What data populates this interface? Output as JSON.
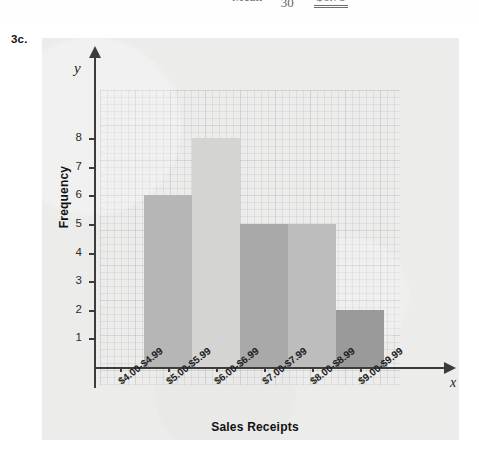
{
  "equation_strip": {
    "label": "Mean =",
    "numerator": "",
    "denominator": "30",
    "equals": "=",
    "result": "$6.75"
  },
  "problem": {
    "number": "3c."
  },
  "chart_data": {
    "type": "bar",
    "title": "",
    "xlabel": "Sales Receipts",
    "ylabel": "Frequency",
    "x_axis_variable": "x",
    "y_axis_variable": "y",
    "categories": [
      "$4.00-$4.99",
      "$5.00-$5.99",
      "$6.00-$6.99",
      "$7.00-$7.99",
      "$8.00-$8.99",
      "$9.00-$9.99"
    ],
    "values": [
      0,
      6,
      8,
      5,
      5,
      2
    ],
    "bar_colors": [
      "#ececeb",
      "#b6b6b6",
      "#d4d4d3",
      "#a9a9a9",
      "#bdbdbd",
      "#9a9a9a"
    ],
    "ytick_labels": [
      "1",
      "2",
      "3",
      "4",
      "5",
      "6",
      "7",
      "8"
    ],
    "ylim": [
      0,
      9
    ],
    "grid": true,
    "legend": false
  },
  "colors": {
    "panel_background": "#ececeb",
    "axis": "#3c3c3c",
    "text": "#1c1c1c",
    "page_background": "#ffffff"
  }
}
